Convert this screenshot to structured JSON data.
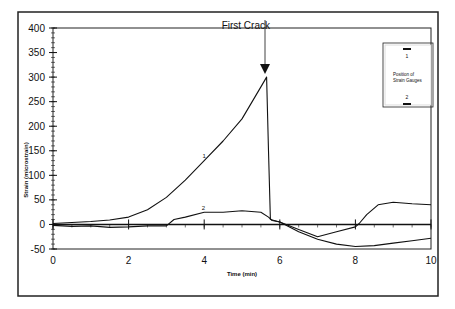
{
  "chart_data": {
    "type": "line",
    "title": "",
    "xlabel": "Time (min)",
    "ylabel": "Strain (microstrain)",
    "xlim": [
      0,
      10
    ],
    "ylim": [
      -50,
      400
    ],
    "x_ticks": [
      "0",
      "2",
      "4",
      "6",
      "8",
      "10"
    ],
    "y_ticks": [
      "400",
      "350",
      "300",
      "250",
      "200",
      "150",
      "100",
      "50",
      "0",
      "-50"
    ],
    "grid": false,
    "annotations": [
      {
        "text": "First Crack",
        "x": 5.65,
        "y": 300,
        "type": "arrow"
      }
    ],
    "inset": {
      "title": "Position of Strain Gauges",
      "gauge_top_label": "1",
      "gauge_bottom_label": "2"
    },
    "series": [
      {
        "name": "1",
        "x": [
          0,
          0.5,
          1,
          1.5,
          2,
          2.5,
          3,
          3.5,
          4,
          4.5,
          5,
          5.5,
          5.65,
          5.7,
          5.75,
          6,
          6.5,
          7,
          7.5,
          8,
          8.5,
          9,
          9.5,
          10
        ],
        "y": [
          2,
          4,
          6,
          9,
          15,
          30,
          55,
          90,
          130,
          170,
          215,
          280,
          300,
          150,
          10,
          5,
          -15,
          -30,
          -40,
          -45,
          -43,
          -38,
          -33,
          -28
        ]
      },
      {
        "name": "2",
        "x": [
          0,
          0.5,
          1,
          1.5,
          2,
          2.5,
          3,
          3.2,
          3.5,
          4,
          4.5,
          5,
          5.5,
          5.7,
          5.8,
          6,
          6.5,
          7,
          7.5,
          8,
          8.1,
          8.3,
          8.6,
          9,
          9.5,
          10
        ],
        "y": [
          -2,
          -4,
          -3,
          -6,
          -5,
          -3,
          -3,
          10,
          15,
          25,
          25,
          28,
          25,
          15,
          8,
          5,
          -10,
          -25,
          -15,
          -5,
          2,
          20,
          40,
          45,
          42,
          40
        ]
      }
    ]
  }
}
